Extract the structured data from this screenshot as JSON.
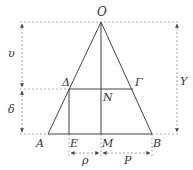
{
  "diagram": {
    "type": "geometry",
    "colors": {
      "line": "#444444",
      "dashed": "#888888",
      "label": "#333333",
      "background": "#ffffff"
    },
    "points": {
      "O": {
        "label": "O",
        "x": 101,
        "y": 22
      },
      "A": {
        "label": "A",
        "x": 48,
        "y": 134
      },
      "B": {
        "label": "B",
        "x": 152,
        "y": 134
      },
      "M": {
        "label": "M",
        "x": 101,
        "y": 134
      },
      "E": {
        "label": "E",
        "x": 69,
        "y": 134
      },
      "Delta": {
        "label": "Δ",
        "x": 69,
        "y": 89
      },
      "Gamma": {
        "label": "Γ",
        "x": 133,
        "y": 89
      },
      "N": {
        "label": "N",
        "x": 101,
        "y": 89
      }
    },
    "dimensions": {
      "upsilon": {
        "label": "υ",
        "from": "O",
        "to": "Delta",
        "side": "left"
      },
      "delta": {
        "label": "δ",
        "from": "Delta",
        "to": "A",
        "side": "left"
      },
      "Y": {
        "label": "Y",
        "from": "O",
        "to": "B",
        "side": "right"
      },
      "rho": {
        "label": "ρ",
        "from": "E",
        "to": "M",
        "side": "bottom"
      },
      "P": {
        "label": "P",
        "from": "M",
        "to": "B",
        "side": "bottom"
      }
    }
  }
}
